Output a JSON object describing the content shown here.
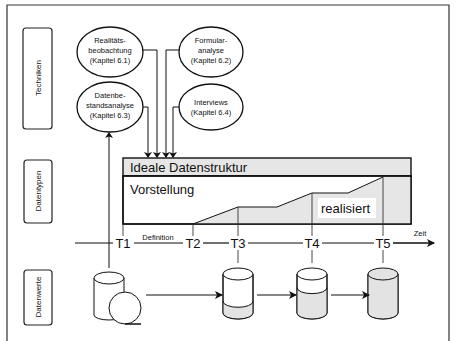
{
  "row_labels": {
    "techniken": "Techniken",
    "datentypen": "Datentypen",
    "datenwerte": "Datenwerte"
  },
  "techniques": [
    {
      "lines": [
        "Realitäts-",
        "beobachtung",
        "(Kapitel 6.1)"
      ]
    },
    {
      "lines": [
        "Formular-",
        "analyse",
        "(Kapitel 6.2)"
      ]
    },
    {
      "lines": [
        "Datenbe-",
        "standsanalyse",
        "(Kapitel 6.3)"
      ]
    },
    {
      "lines": [
        "Interviews",
        "(Kapitel 6.4)"
      ]
    }
  ],
  "structure": {
    "header": "Ideale Datenstruktur",
    "idea": "Vorstellung",
    "realized": "realisiert"
  },
  "timeline": {
    "points": [
      "T1",
      "T2",
      "T3",
      "T4",
      "T5"
    ],
    "definition": "Definition",
    "axis_label": "Zeit"
  },
  "database_fill_levels": [
    0,
    0.3,
    0.65,
    1.0
  ]
}
